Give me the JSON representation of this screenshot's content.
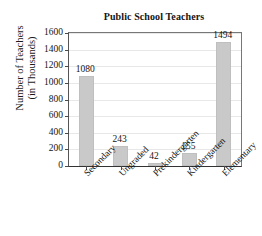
{
  "chart_data": {
    "type": "bar",
    "title": "Public School Teachers",
    "xlabel": "",
    "ylabel_line1": "Number of Teachers",
    "ylabel_line2": "(in Thousands)",
    "categories": [
      "Secondary",
      "Ungraded",
      "Prekindergarten",
      "Kindergarten",
      "Elementary"
    ],
    "values": [
      1080,
      243,
      42,
      155,
      1494
    ],
    "value_labels": [
      "1080",
      "243",
      "42",
      "155",
      "1494"
    ],
    "ylim": [
      0,
      1600
    ],
    "yticks": [
      0,
      200,
      400,
      600,
      800,
      1000,
      1200,
      1400,
      1600
    ],
    "ytick_labels": [
      "0",
      "200",
      "400",
      "600",
      "800",
      "1000",
      "1200",
      "1400",
      "1600"
    ],
    "grid": true,
    "legend": "none",
    "bar_color": "#c9c9c9",
    "axis_color": "#333333",
    "grid_color": "#e8e8e8",
    "background": "#ffffff"
  }
}
